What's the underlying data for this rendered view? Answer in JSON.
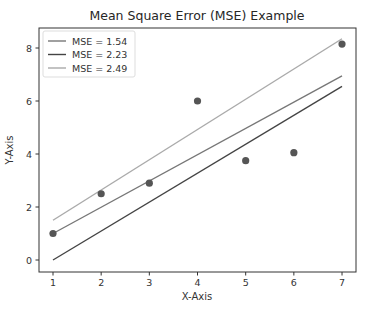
{
  "chart_data": {
    "type": "scatter",
    "title": "Mean Square Error (MSE) Example",
    "xlabel": "X-Axis",
    "ylabel": "Y-Axis",
    "xlim": [
      0.7,
      7.3
    ],
    "ylim": [
      -0.45,
      8.75
    ],
    "xticks": [
      1,
      2,
      3,
      4,
      5,
      6,
      7
    ],
    "yticks": [
      0,
      2,
      4,
      6,
      8
    ],
    "grid": false,
    "legend_position": "upper left",
    "points": {
      "x": [
        1,
        2,
        3,
        4,
        5,
        6,
        7
      ],
      "y": [
        1.0,
        2.5,
        2.9,
        6.0,
        3.75,
        4.05,
        8.15
      ],
      "color": "#555555"
    },
    "series": [
      {
        "name": "MSE = 1.54",
        "type": "line",
        "color": "#777777",
        "x": [
          1,
          7
        ],
        "y": [
          1.0,
          6.95
        ]
      },
      {
        "name": "MSE = 2.23",
        "type": "line",
        "color": "#444444",
        "x": [
          1,
          7
        ],
        "y": [
          0.0,
          6.55
        ]
      },
      {
        "name": "MSE = 2.49",
        "type": "line",
        "color": "#aaaaaa",
        "x": [
          1,
          7
        ],
        "y": [
          1.5,
          8.35
        ]
      }
    ]
  }
}
